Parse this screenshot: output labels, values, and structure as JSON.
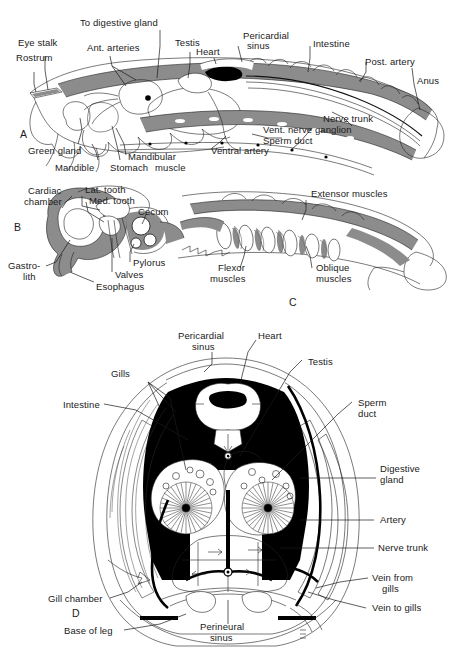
{
  "figure": {
    "background_color": "#ffffff",
    "ink_color": "#1a1a1a",
    "gray_fill": "#8c8c8c",
    "light_gray_fill": "#c9c9c9",
    "black_fill": "#000000",
    "width": 453,
    "height": 660
  },
  "panels": [
    {
      "letter": "A",
      "caption": "Lateral sagittal section of whole crayfish",
      "labels": [
        "Eye stalk",
        "Rostrum",
        "To digestive gland",
        "Ant. arteries",
        "Testis",
        "Heart",
        "Pericardial sinus",
        "Intestine",
        "Post. artery",
        "Anus",
        "Nerve trunk",
        "Vent. nerve ganglion",
        "Sperm duct",
        "Ventral artery",
        "Mandibular muscle",
        "Stomach",
        "Mandible",
        "Green gland"
      ]
    },
    {
      "letter": "B",
      "caption": "Stomach detail",
      "labels": [
        "Cardiac chamber",
        "Lat. tooth",
        "Med. tooth",
        "Cecum",
        "Pylorus",
        "Valves",
        "Esophagus",
        "Gastrolith"
      ]
    },
    {
      "letter": "C",
      "caption": "Abdominal musculature",
      "labels": [
        "Extensor muscles",
        "Flexor muscles",
        "Oblique muscles"
      ]
    },
    {
      "letter": "D",
      "caption": "Transverse section through thorax",
      "labels": [
        "Pericardial sinus",
        "Heart",
        "Testis",
        "Gills",
        "Intestine",
        "Sperm duct",
        "Digestive gland",
        "Artery",
        "Nerve trunk",
        "Vein from gills",
        "Vein to gills",
        "Gill chamber",
        "Base of leg",
        "Perineural sinus"
      ]
    }
  ],
  "panel_a": {
    "letter": "A",
    "eye_stalk": "Eye stalk",
    "rostrum": "Rostrum",
    "to_digestive_gland": "To digestive gland",
    "ant_arteries": "Ant. arteries",
    "testis": "Testis",
    "heart": "Heart",
    "pericardial_sinus_l1": "Pericardial",
    "pericardial_sinus_l2": "sinus",
    "intestine": "Intestine",
    "post_artery": "Post. artery",
    "anus": "Anus",
    "nerve_trunk": "Nerve trunk",
    "vent_nerve_ganglion": "Vent. nerve ganglion",
    "sperm_duct": "Sperm duct",
    "ventral_artery": "Ventral artery",
    "mandibular": "Mandibular",
    "muscle": "muscle",
    "stomach": "Stomach",
    "mandible": "Mandible",
    "green_gland": "Green gland"
  },
  "panel_b": {
    "letter": "B",
    "cardiac_l1": "Cardiac",
    "cardiac_l2": "chamber",
    "lat_tooth": "Lat. tooth",
    "med_tooth": "Med. tooth",
    "cecum": "Cecum",
    "pylorus": "Pylorus",
    "valves": "Valves",
    "esophagus": "Esophagus",
    "gastro_l1": "Gastro-",
    "gastro_l2": "lith"
  },
  "panel_c": {
    "letter": "C",
    "extensor_muscles": "Extensor muscles",
    "flexor_l1": "Flexor",
    "flexor_l2": "muscles",
    "oblique_l1": "Oblique",
    "oblique_l2": "muscles"
  },
  "panel_d": {
    "letter": "D",
    "pericardial_l1": "Pericardial",
    "pericardial_l2": "sinus",
    "heart": "Heart",
    "testis": "Testis",
    "gills": "Gills",
    "intestine": "Intestine",
    "sperm_l1": "Sperm",
    "sperm_l2": "duct",
    "digestive_l1": "Digestive",
    "digestive_l2": "gland",
    "artery": "Artery",
    "nerve_trunk": "Nerve trunk",
    "vein_from_l1": "Vein from",
    "vein_from_l2": "gills",
    "vein_to_gills": "Vein to gills",
    "gill_chamber": "Gill chamber",
    "base_of_leg": "Base of leg",
    "perineural_l1": "Perineural",
    "perineural_l2": "sinus"
  }
}
